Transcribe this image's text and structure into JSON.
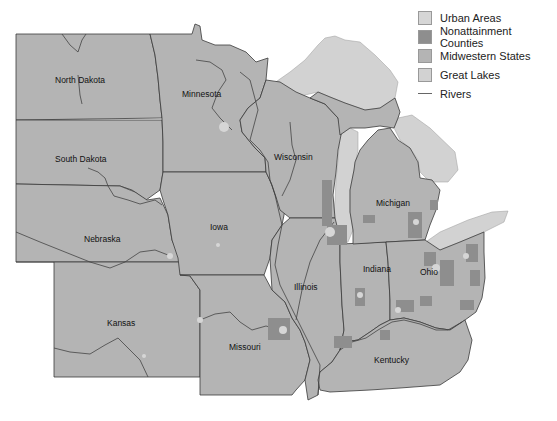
{
  "legend": {
    "items": [
      {
        "label": "Urban Areas",
        "type": "swatch",
        "color": "#d6d6d6"
      },
      {
        "label": "Nonattainment Counties",
        "type": "swatch",
        "color": "#8e8e8e"
      },
      {
        "label": "Midwestern States",
        "type": "swatch",
        "color": "#b4b4b4"
      },
      {
        "label": "Great Lakes",
        "type": "swatch",
        "color": "#d2d2d2"
      },
      {
        "label": "Rivers",
        "type": "line",
        "color": "#555555"
      }
    ]
  },
  "states": [
    {
      "name": "North Dakota",
      "x": 80,
      "y": 83
    },
    {
      "name": "Minnesota",
      "x": 203,
      "y": 97
    },
    {
      "name": "South Dakota",
      "x": 81,
      "y": 162
    },
    {
      "name": "Wisconsin",
      "x": 295,
      "y": 160
    },
    {
      "name": "Michigan",
      "x": 393,
      "y": 206
    },
    {
      "name": "Iowa",
      "x": 219,
      "y": 230
    },
    {
      "name": "Nebraska",
      "x": 102,
      "y": 242
    },
    {
      "name": "Indiana",
      "x": 379,
      "y": 272
    },
    {
      "name": "Ohio",
      "x": 429,
      "y": 275
    },
    {
      "name": "Illinois",
      "x": 307,
      "y": 290
    },
    {
      "name": "Kansas",
      "x": 121,
      "y": 326
    },
    {
      "name": "Missouri",
      "x": 245,
      "y": 350
    },
    {
      "name": "Kentucky",
      "x": 390,
      "y": 363
    }
  ],
  "colors": {
    "states": "#b4b4b4",
    "lakes": "#d2d2d2",
    "nonattainment": "#8e8e8e",
    "urban": "#d6d6d6",
    "borders": "#3a3a3a"
  }
}
